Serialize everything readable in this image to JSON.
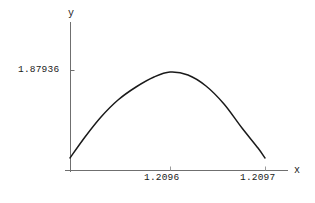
{
  "chart_data": {
    "type": "line",
    "title": "",
    "subtitle": "",
    "xlabel": "x",
    "ylabel": "y",
    "grid": false,
    "legend": null,
    "axis_style": "mathematica-axes",
    "xlim": [
      1.20955,
      1.209715
    ],
    "ylim": [
      1.879352,
      1.879366
    ],
    "xticks": [
      {
        "value": 1.2096,
        "label": "1.2096",
        "px": 170
      },
      {
        "value": 1.2097,
        "label": "1.2097",
        "px": 265
      }
    ],
    "yticks": [
      {
        "value": 1.87936,
        "label": "1.87936",
        "px": 70
      }
    ],
    "series": [
      {
        "name": "curve",
        "color": "#1a1a1a",
        "x": [
          1.209556,
          1.209572,
          1.209589,
          1.209607,
          1.209626,
          1.209646,
          1.209667,
          1.209688,
          1.20971,
          1.209712
        ],
        "y": [
          1.8793533,
          1.8793567,
          1.8793592,
          1.8793608,
          1.8793615,
          1.8793612,
          1.87936,
          1.8793578,
          1.879354,
          1.8793533
        ],
        "points_px": [
          [
            70,
            158
          ],
          [
            85,
            137
          ],
          [
            101,
            117
          ],
          [
            118,
            100
          ],
          [
            136,
            87
          ],
          [
            154,
            77
          ],
          [
            170,
            72
          ],
          [
            188,
            75
          ],
          [
            206,
            86
          ],
          [
            224,
            104
          ],
          [
            242,
            128
          ],
          [
            258,
            148
          ],
          [
            265,
            158
          ]
        ]
      }
    ],
    "peak": {
      "x": 1.2096,
      "y": 1.87936,
      "px": [
        170,
        72
      ]
    },
    "axes_px": {
      "y_axis_x": 70,
      "y_axis_top": 22,
      "y_axis_bottom": 172,
      "x_axis_y": 170,
      "x_axis_left": 65,
      "x_axis_right": 288
    }
  },
  "labels": {
    "y_tick_1": "1.87936",
    "x_tick_1": "1.2096",
    "x_tick_2": "1.2097",
    "y_axis_name": "y",
    "x_axis_name": "x"
  }
}
